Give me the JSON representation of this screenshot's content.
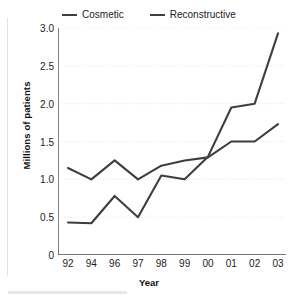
{
  "chart_data": {
    "type": "line",
    "title": "",
    "xlabel": "Year",
    "ylabel": "Millions of patients",
    "categories": [
      "92",
      "94",
      "96",
      "97",
      "98",
      "99",
      "00",
      "01",
      "02",
      "03"
    ],
    "x": [
      "92",
      "94",
      "96",
      "97",
      "98",
      "99",
      "00",
      "01",
      "02",
      "03"
    ],
    "series": [
      {
        "name": "Cosmetic",
        "color": "#3e3e3e",
        "values": [
          0.43,
          0.42,
          0.78,
          0.5,
          1.05,
          1.0,
          1.3,
          1.95,
          2.0,
          2.93
        ]
      },
      {
        "name": "Reconstructive",
        "color": "#3e3e3e",
        "values": [
          1.15,
          1.0,
          1.25,
          1.0,
          1.18,
          1.25,
          1.29,
          1.5,
          1.5,
          1.73
        ]
      }
    ],
    "ylim": [
      0,
      3.0
    ],
    "yticks": [
      0,
      0.5,
      1.0,
      1.5,
      2.0,
      2.5,
      3.0
    ],
    "ytick_labels": [
      "0",
      "0.5",
      "1.0",
      "1.5",
      "2.0",
      "2.5",
      "3.0"
    ],
    "grid": true,
    "grid_axis": "y",
    "grid_style": "dotted",
    "legend_position": "top-center",
    "legend": [
      "Cosmetic",
      "Reconstructive"
    ]
  },
  "legend": {
    "items": [
      {
        "label": "Cosmetic",
        "swatch": "line-swatch-icon"
      },
      {
        "label": "Reconstructive",
        "swatch": "line-swatch-icon"
      }
    ]
  },
  "axes": {
    "y_title": "Millions of patients",
    "x_title": "Year"
  },
  "colors": {
    "line": "#3e3e3e",
    "axis": "#4a4a4a",
    "grid": "#e6e6e6",
    "text": "#1c1c1c",
    "background": "#ffffff"
  }
}
